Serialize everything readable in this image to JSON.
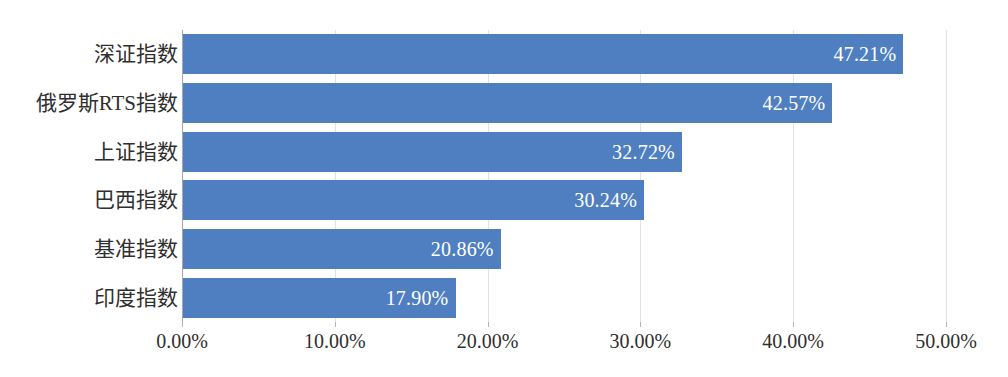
{
  "chart_data": {
    "type": "bar",
    "orientation": "horizontal",
    "title": "",
    "subtitle": "",
    "xlabel": "",
    "ylabel": "",
    "categories": [
      "深证指数",
      "俄罗斯RTS指数",
      "上证指数",
      "巴西指数",
      "基准指数",
      "印度指数"
    ],
    "values": [
      47.21,
      42.57,
      32.72,
      30.24,
      20.86,
      17.9
    ],
    "data_labels": [
      "47.21%",
      "42.57%",
      "32.72%",
      "30.24%",
      "20.86%",
      "17.90%"
    ],
    "xlim": [
      0,
      50
    ],
    "xtick_values": [
      0,
      10,
      20,
      30,
      40,
      50
    ],
    "xtick_labels": [
      "0.00%",
      "10.00%",
      "20.00%",
      "30.00%",
      "40.00%",
      "50.00%"
    ],
    "grid": "vertical",
    "legend": "none",
    "value_unit": "%",
    "bar_color": "#4f7fc1",
    "gridline_color": "#e2e2e4",
    "axis_color": "#a8a8aa",
    "label_text_color": "#2f2f2f",
    "data_label_color": "#ffffff",
    "data_label_position": "inside-end",
    "background_color": "#ffffff"
  }
}
